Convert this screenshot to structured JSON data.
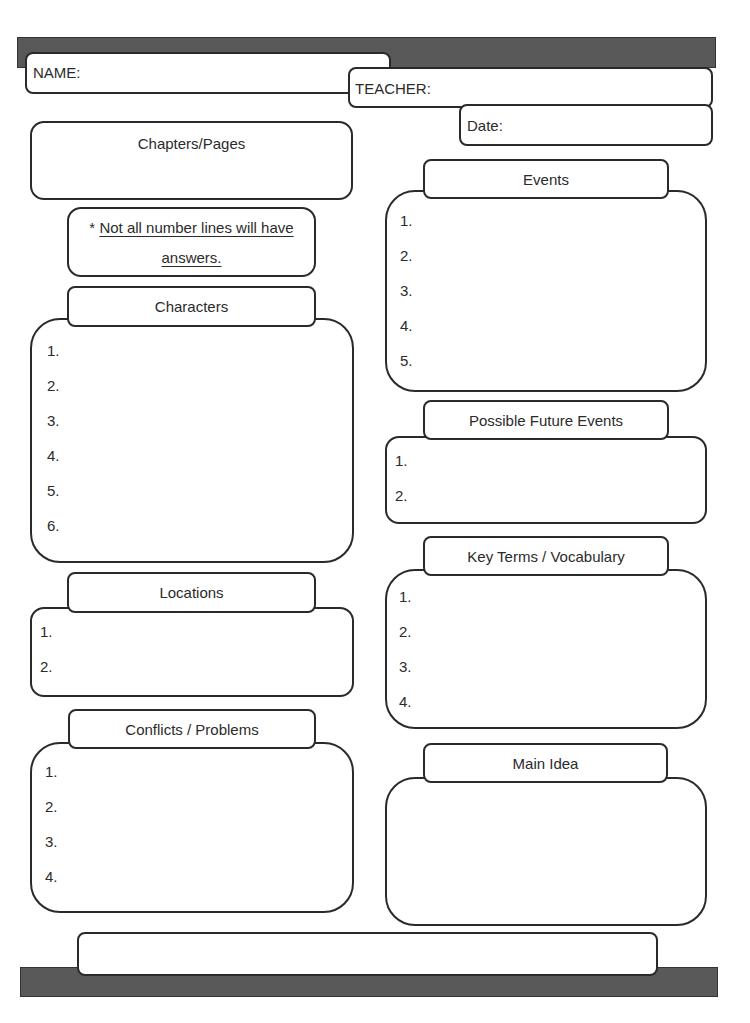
{
  "header": {
    "name_label": "NAME:",
    "teacher_label": "TEACHER:",
    "date_label": "Date:"
  },
  "chapters": {
    "title": "Chapters/Pages"
  },
  "note": {
    "asterisk": "* ",
    "line1": "Not all number lines will have",
    "line2": "answers."
  },
  "characters": {
    "title": "Characters",
    "items": [
      "1.",
      "2.",
      "3.",
      "4.",
      "5.",
      "6."
    ]
  },
  "locations": {
    "title": "Locations",
    "items": [
      "1.",
      "2."
    ]
  },
  "conflicts": {
    "title": "Conflicts / Problems",
    "items": [
      "1.",
      "2.",
      "3.",
      "4."
    ]
  },
  "events": {
    "title": "Events",
    "items": [
      "1.",
      "2.",
      "3.",
      "4.",
      "5."
    ]
  },
  "future_events": {
    "title": "Possible Future Events",
    "items": [
      "1.",
      "2."
    ]
  },
  "vocabulary": {
    "title": "Key Terms / Vocabulary",
    "items": [
      "1.",
      "2.",
      "3.",
      "4."
    ]
  },
  "main_idea": {
    "title": "Main Idea"
  },
  "colors": {
    "bar": "#595959",
    "border": "#2a2a2a",
    "text": "#2b2b2b"
  }
}
